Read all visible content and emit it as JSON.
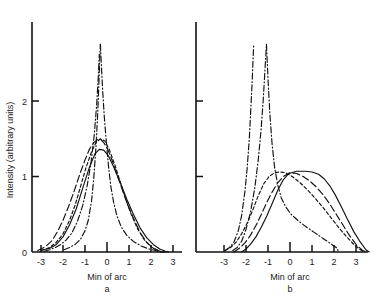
{
  "figure": {
    "ylabel": "Intensity (arbitrary units)",
    "y_ticks": [
      {
        "value": 0,
        "label": "0"
      },
      {
        "value": 1,
        "label": "1"
      },
      {
        "value": 2,
        "label": "2"
      }
    ],
    "x_ticks": [
      {
        "value": -3,
        "label": "-3"
      },
      {
        "value": -2,
        "label": "-2"
      },
      {
        "value": -1,
        "label": "-1"
      },
      {
        "value": 0,
        "label": "0"
      },
      {
        "value": 1,
        "label": "1"
      },
      {
        "value": 2,
        "label": "2"
      },
      {
        "value": 3,
        "label": "3"
      }
    ]
  },
  "panel_a": {
    "xlabel": "Min of arc",
    "label": "a"
  },
  "panel_b": {
    "xlabel": "Min of arc",
    "label": "b"
  },
  "chart_data": {
    "type": "line",
    "title": "",
    "xlabel": "Min of arc",
    "ylabel": "Intensity (arbitrary units)",
    "xlim": [
      -3.6,
      3.7
    ],
    "ylim": [
      0,
      2.75
    ],
    "grid": false,
    "legend": "none",
    "panels": [
      {
        "name": "a",
        "label": "a",
        "xlabel": "Min of arc",
        "series": [
          {
            "name": "solid-broad-peak",
            "style": "solid",
            "x": [
              -3.0,
              -2.6,
              -2.3,
              -2.0,
              -1.7,
              -1.4,
              -1.1,
              -0.8,
              -0.55,
              -0.35,
              -0.15,
              0.05,
              0.3,
              0.6,
              0.9,
              1.2,
              1.5,
              1.8,
              2.1,
              2.4,
              2.65,
              2.8
            ],
            "y": [
              0.02,
              0.05,
              0.1,
              0.2,
              0.36,
              0.57,
              0.85,
              1.12,
              1.3,
              1.36,
              1.35,
              1.28,
              1.13,
              0.92,
              0.7,
              0.5,
              0.32,
              0.19,
              0.1,
              0.04,
              0.01,
              0.0
            ]
          },
          {
            "name": "short-dash-peak",
            "style": "dashed-short",
            "x": [
              -3.0,
              -2.6,
              -2.3,
              -2.0,
              -1.7,
              -1.45,
              -1.2,
              -0.95,
              -0.7,
              -0.5,
              -0.3,
              -0.1,
              0.1,
              0.35,
              0.6,
              0.85,
              1.1,
              1.4,
              1.7,
              2.0,
              2.3,
              2.55,
              2.7
            ],
            "y": [
              0.02,
              0.06,
              0.13,
              0.24,
              0.42,
              0.62,
              0.87,
              1.12,
              1.33,
              1.45,
              1.5,
              1.47,
              1.36,
              1.16,
              0.93,
              0.7,
              0.5,
              0.3,
              0.16,
              0.07,
              0.02,
              0.0,
              0.0
            ]
          },
          {
            "name": "long-dash-peak",
            "style": "dashed-long",
            "x": [
              -3.15,
              -2.8,
              -2.5,
              -2.25,
              -2.0,
              -1.75,
              -1.5,
              -1.25,
              -1.0,
              -0.8,
              -0.6,
              -0.42,
              -0.28,
              -0.15,
              0.0,
              0.2,
              0.45,
              0.7,
              0.95,
              1.2,
              1.5,
              1.8,
              2.1,
              2.4,
              2.6
            ],
            "y": [
              0.02,
              0.07,
              0.15,
              0.27,
              0.42,
              0.6,
              0.8,
              1.02,
              1.22,
              1.36,
              1.45,
              1.49,
              1.49,
              1.45,
              1.38,
              1.24,
              1.03,
              0.82,
              0.62,
              0.45,
              0.26,
              0.13,
              0.05,
              0.01,
              0.0
            ]
          },
          {
            "name": "dash-dot-narrow-left",
            "style": "dash-dot",
            "x": [
              -1.95,
              -1.7,
              -1.45,
              -1.2,
              -1.0,
              -0.85,
              -0.7,
              -0.6,
              -0.5,
              -0.42,
              -0.36,
              -0.32,
              -0.3
            ],
            "y": [
              0.03,
              0.06,
              0.1,
              0.17,
              0.28,
              0.42,
              0.68,
              0.98,
              1.4,
              1.85,
              2.3,
              2.62,
              2.75
            ]
          },
          {
            "name": "dash-dot-narrow-right",
            "style": "dash-dot",
            "x": [
              -0.3,
              -0.26,
              -0.2,
              -0.12,
              -0.02,
              0.08,
              0.18,
              0.3,
              0.45,
              0.65,
              0.9,
              1.2,
              1.55,
              1.9,
              2.2,
              2.45,
              2.6
            ],
            "y": [
              2.75,
              2.5,
              2.15,
              1.78,
              1.42,
              1.1,
              0.86,
              0.66,
              0.48,
              0.33,
              0.22,
              0.14,
              0.08,
              0.04,
              0.02,
              0.0,
              0.0
            ]
          },
          {
            "name": "dash-dot-wide-shoulder",
            "style": "dash-dot",
            "x": [
              -2.85,
              -2.6,
              -2.35,
              -2.1,
              -1.85,
              -1.6,
              -1.35,
              -1.1,
              -0.9,
              -0.72,
              -0.58,
              -0.47,
              -0.4,
              -0.35
            ],
            "y": [
              0.01,
              0.03,
              0.06,
              0.1,
              0.16,
              0.25,
              0.4,
              0.62,
              0.88,
              1.2,
              1.55,
              1.95,
              2.3,
              2.62
            ]
          }
        ]
      },
      {
        "name": "b",
        "label": "b",
        "xlabel": "Min of arc",
        "series": [
          {
            "name": "solid-flat-top",
            "style": "solid",
            "x": [
              -2.2,
              -2.0,
              -1.8,
              -1.55,
              -1.3,
              -1.05,
              -0.8,
              -0.55,
              -0.3,
              -0.05,
              0.3,
              0.7,
              1.0,
              1.3,
              1.55,
              1.8,
              2.05,
              2.3,
              2.6,
              2.9,
              3.2,
              3.45,
              3.6
            ],
            "y": [
              0.0,
              0.04,
              0.1,
              0.2,
              0.33,
              0.48,
              0.65,
              0.82,
              0.96,
              1.04,
              1.07,
              1.07,
              1.06,
              1.03,
              0.97,
              0.88,
              0.76,
              0.62,
              0.44,
              0.27,
              0.13,
              0.03,
              0.0
            ]
          },
          {
            "name": "long-dash-rounded",
            "style": "dashed-long",
            "x": [
              -2.55,
              -2.3,
              -2.05,
              -1.8,
              -1.55,
              -1.3,
              -1.05,
              -0.8,
              -0.55,
              -0.3,
              0.0,
              0.3,
              0.6,
              0.9,
              1.2,
              1.5,
              1.8,
              2.1,
              2.4,
              2.7,
              3.0,
              3.3,
              3.5
            ],
            "y": [
              0.0,
              0.05,
              0.12,
              0.22,
              0.35,
              0.5,
              0.66,
              0.8,
              0.92,
              1.0,
              1.05,
              1.04,
              1.0,
              0.94,
              0.86,
              0.76,
              0.64,
              0.5,
              0.36,
              0.22,
              0.1,
              0.02,
              0.0
            ]
          },
          {
            "name": "short-dash-skewed",
            "style": "dashed-short",
            "x": [
              -2.95,
              -2.7,
              -2.45,
              -2.2,
              -1.95,
              -1.7,
              -1.45,
              -1.2,
              -0.95,
              -0.7,
              -0.45,
              -0.2,
              0.1,
              0.45,
              0.8,
              1.15,
              1.5,
              1.85,
              2.2,
              2.55,
              2.9,
              3.2,
              3.4
            ],
            "y": [
              0.02,
              0.06,
              0.13,
              0.24,
              0.38,
              0.55,
              0.74,
              0.9,
              1.0,
              1.05,
              1.06,
              1.05,
              1.0,
              0.92,
              0.82,
              0.71,
              0.59,
              0.46,
              0.33,
              0.21,
              0.1,
              0.03,
              0.0
            ]
          },
          {
            "name": "dash-dot-spike-left",
            "style": "dash-dot",
            "x": [
              -2.95,
              -2.75,
              -2.55,
              -2.35,
              -2.2,
              -2.05,
              -1.95,
              -1.85,
              -1.78,
              -1.72,
              -1.68,
              -1.65
            ],
            "y": [
              0.02,
              0.06,
              0.13,
              0.28,
              0.48,
              0.8,
              1.1,
              1.5,
              1.9,
              2.25,
              2.55,
              2.75
            ]
          },
          {
            "name": "dash-dot-spike-right-rise",
            "style": "dash-dot",
            "x": [
              -2.6,
              -2.4,
              -2.2,
              -2.0,
              -1.8,
              -1.6,
              -1.45,
              -1.32,
              -1.22,
              -1.15,
              -1.1,
              -1.07
            ],
            "y": [
              0.02,
              0.06,
              0.14,
              0.3,
              0.52,
              0.85,
              1.2,
              1.6,
              2.0,
              2.35,
              2.6,
              2.75
            ]
          },
          {
            "name": "dash-dot-decay-tail",
            "style": "dash-dot",
            "x": [
              -1.07,
              -1.0,
              -0.92,
              -0.82,
              -0.7,
              -0.55,
              -0.4,
              -0.2,
              0.05,
              0.35,
              0.7,
              1.1,
              1.5,
              1.9,
              2.15,
              2.2
            ],
            "y": [
              2.75,
              2.3,
              1.85,
              1.45,
              1.12,
              0.88,
              0.72,
              0.6,
              0.5,
              0.42,
              0.34,
              0.26,
              0.18,
              0.1,
              0.05,
              0.0
            ]
          }
        ]
      }
    ]
  }
}
